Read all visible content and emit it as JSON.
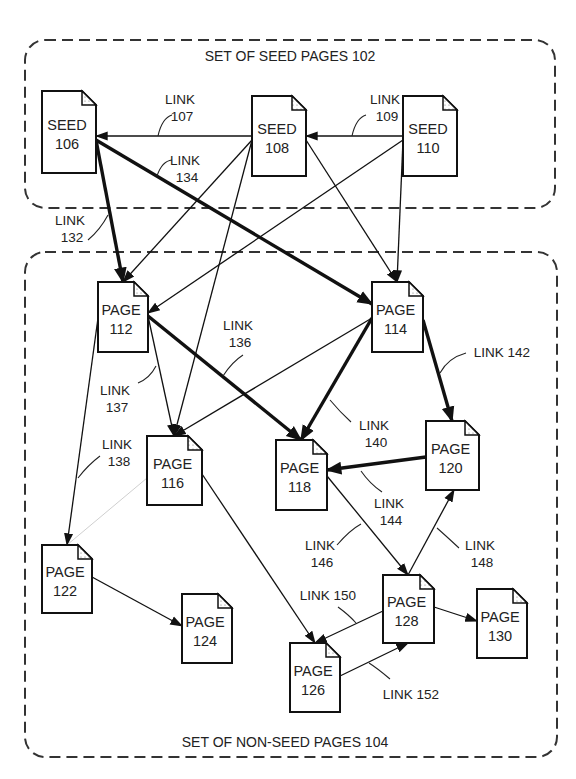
{
  "groups": [
    {
      "id": "102",
      "label": "SET OF SEED PAGES 102",
      "x": 25,
      "y": 40,
      "w": 530,
      "h": 168,
      "label_x": 290,
      "label_y": 61
    },
    {
      "id": "104",
      "label": "SET OF NON-SEED PAGES 104",
      "x": 25,
      "y": 252,
      "w": 532,
      "h": 505,
      "label_x": 285,
      "label_y": 747
    }
  ],
  "nodes": [
    {
      "id": "106",
      "line1": "SEED",
      "line2": "106",
      "x": 42,
      "y": 91,
      "w": 54,
      "h": 82
    },
    {
      "id": "108",
      "line1": "SEED",
      "line2": "108",
      "x": 252,
      "y": 96,
      "w": 54,
      "h": 80
    },
    {
      "id": "110",
      "line1": "SEED",
      "line2": "110",
      "x": 403,
      "y": 96,
      "w": 54,
      "h": 80
    },
    {
      "id": "112",
      "line1": "PAGE",
      "line2": "112",
      "x": 98,
      "y": 282,
      "w": 50,
      "h": 70
    },
    {
      "id": "114",
      "line1": "PAGE",
      "line2": "114",
      "x": 372,
      "y": 282,
      "w": 51,
      "h": 70
    },
    {
      "id": "116",
      "line1": "PAGE",
      "line2": "116",
      "x": 147,
      "y": 436,
      "w": 55,
      "h": 69
    },
    {
      "id": "118",
      "line1": "PAGE",
      "line2": "118",
      "x": 276,
      "y": 440,
      "w": 51,
      "h": 70
    },
    {
      "id": "120",
      "line1": "PAGE",
      "line2": "120",
      "x": 426,
      "y": 421,
      "w": 53,
      "h": 69
    },
    {
      "id": "122",
      "line1": "PAGE",
      "line2": "122",
      "x": 42,
      "y": 545,
      "w": 50,
      "h": 68
    },
    {
      "id": "124",
      "line1": "PAGE",
      "line2": "124",
      "x": 182,
      "y": 594,
      "w": 50,
      "h": 69
    },
    {
      "id": "126",
      "line1": "PAGE",
      "line2": "126",
      "x": 290,
      "y": 643,
      "w": 50,
      "h": 69
    },
    {
      "id": "128",
      "line1": "PAGE",
      "line2": "128",
      "x": 383,
      "y": 575,
      "w": 51,
      "h": 68
    },
    {
      "id": "130",
      "line1": "PAGE",
      "line2": "130",
      "x": 477,
      "y": 589,
      "w": 50,
      "h": 69
    }
  ],
  "edges": [
    {
      "from": [
        252,
        136
      ],
      "to": [
        96,
        136
      ],
      "bold": false,
      "label_id": "107"
    },
    {
      "from": [
        403,
        136
      ],
      "to": [
        306,
        136
      ],
      "bold": false,
      "label_id": "109"
    },
    {
      "from": [
        96,
        140
      ],
      "to": [
        372,
        304
      ],
      "bold": true,
      "label_id": "134"
    },
    {
      "from": [
        96,
        140
      ],
      "to": [
        123,
        282
      ],
      "bold": true,
      "label_id": "132"
    },
    {
      "from": [
        252,
        140
      ],
      "to": [
        123,
        282
      ],
      "bold": false
    },
    {
      "from": [
        252,
        140
      ],
      "to": [
        174,
        436
      ],
      "bold": false
    },
    {
      "from": [
        306,
        140
      ],
      "to": [
        397,
        282
      ],
      "bold": false
    },
    {
      "from": [
        403,
        140
      ],
      "to": [
        148,
        313
      ],
      "bold": false
    },
    {
      "from": [
        403,
        140
      ],
      "to": [
        397,
        282
      ],
      "bold": false
    },
    {
      "from": [
        148,
        316
      ],
      "to": [
        301,
        440
      ],
      "bold": true,
      "label_id": "136"
    },
    {
      "from": [
        148,
        316
      ],
      "to": [
        174,
        436
      ],
      "bold": false,
      "label_id": "137"
    },
    {
      "from": [
        98,
        318
      ],
      "to": [
        67,
        545
      ],
      "bold": false,
      "label_id": "138"
    },
    {
      "from": [
        372,
        318
      ],
      "to": [
        174,
        436
      ],
      "bold": false
    },
    {
      "from": [
        372,
        318
      ],
      "to": [
        301,
        440
      ],
      "bold": true,
      "label_id": "140"
    },
    {
      "from": [
        423,
        320
      ],
      "to": [
        452,
        421
      ],
      "bold": true,
      "label_id": "142"
    },
    {
      "from": [
        426,
        457
      ],
      "to": [
        327,
        470
      ],
      "bold": true,
      "label_id": "144"
    },
    {
      "from": [
        327,
        476
      ],
      "to": [
        408,
        575
      ],
      "bold": false,
      "label_id": "146"
    },
    {
      "from": [
        408,
        575
      ],
      "to": [
        454,
        490
      ],
      "bold": false,
      "label_id": "148"
    },
    {
      "from": [
        383,
        611
      ],
      "to": [
        315,
        643
      ],
      "bold": false,
      "label_id": "150"
    },
    {
      "from": [
        340,
        676
      ],
      "to": [
        408,
        643
      ],
      "bold": false,
      "label_id": "152"
    },
    {
      "from": [
        202,
        474
      ],
      "to": [
        315,
        643
      ],
      "bold": false
    },
    {
      "from": [
        92,
        577
      ],
      "to": [
        182,
        626
      ],
      "bold": false
    },
    {
      "from": [
        434,
        607
      ],
      "to": [
        477,
        621
      ],
      "bold": false
    },
    {
      "from": [
        147,
        478
      ],
      "to": [
        67,
        545
      ],
      "bold": false,
      "faint": true
    }
  ],
  "link_labels": [
    {
      "id": "107",
      "line1": "LINK",
      "line2": "107",
      "x": 180,
      "y": 104,
      "lead": [
        [
          158,
          136
        ],
        [
          162,
          118
        ],
        [
          172,
          115
        ]
      ]
    },
    {
      "id": "109",
      "line1": "LINK",
      "line2": "109",
      "x": 385,
      "y": 104,
      "lead": [
        [
          352,
          136
        ],
        [
          356,
          118
        ],
        [
          366,
          115
        ]
      ]
    },
    {
      "id": "134",
      "line1": "LINK",
      "line2": "134",
      "x": 185,
      "y": 165,
      "lead": [
        [
          157,
          176
        ],
        [
          162,
          161
        ],
        [
          172,
          160
        ]
      ]
    },
    {
      "id": "132",
      "line1": "LINK",
      "line2": "132",
      "x": 70,
      "y": 225,
      "lead": [
        [
          108,
          215
        ],
        [
          100,
          230
        ],
        [
          88,
          240
        ]
      ]
    },
    {
      "id": "136",
      "line1": "LINK",
      "line2": "136",
      "x": 238,
      "y": 330,
      "lead": [
        [
          223,
          376
        ],
        [
          232,
          362
        ],
        [
          243,
          355
        ]
      ]
    },
    {
      "id": "137",
      "line1": "LINK",
      "line2": "137",
      "x": 115,
      "y": 395,
      "lead": [
        [
          156,
          366
        ],
        [
          150,
          378
        ],
        [
          138,
          383
        ]
      ]
    },
    {
      "id": "138",
      "line1": "LINK",
      "line2": "138",
      "x": 117,
      "y": 449,
      "lead": [
        [
          78,
          478
        ],
        [
          88,
          465
        ],
        [
          100,
          456
        ]
      ]
    },
    {
      "id": "140",
      "line1": "LINK",
      "line2": "140",
      "x": 374,
      "y": 430,
      "lead": [
        [
          330,
          400
        ],
        [
          340,
          412
        ],
        [
          351,
          422
        ]
      ]
    },
    {
      "id": "142",
      "line1": "LINK 142",
      "line2": "",
      "x": 502,
      "y": 357,
      "lead": [
        [
          440,
          373
        ],
        [
          448,
          358
        ],
        [
          466,
          353
        ]
      ]
    },
    {
      "id": "144",
      "line1": "LINK",
      "line2": "144",
      "x": 389,
      "y": 508,
      "lead": [
        [
          361,
          471
        ],
        [
          370,
          484
        ],
        [
          382,
          492
        ]
      ]
    },
    {
      "id": "146",
      "line1": "LINK",
      "line2": "146",
      "x": 320,
      "y": 550,
      "lead": [
        [
          361,
          524
        ],
        [
          350,
          530
        ],
        [
          337,
          545
        ]
      ]
    },
    {
      "id": "148",
      "line1": "LINK",
      "line2": "148",
      "x": 480,
      "y": 550,
      "lead": [
        [
          437,
          528
        ],
        [
          445,
          535
        ],
        [
          459,
          548
        ]
      ]
    },
    {
      "id": "150",
      "line1": "LINK 150",
      "line2": "",
      "x": 328,
      "y": 600,
      "lead": [
        [
          356,
          623
        ],
        [
          349,
          615
        ],
        [
          338,
          607
        ]
      ]
    },
    {
      "id": "152",
      "line1": "LINK 152",
      "line2": "",
      "x": 411,
      "y": 699,
      "lead": [
        [
          369,
          663
        ],
        [
          377,
          668
        ],
        [
          390,
          679
        ]
      ]
    }
  ]
}
